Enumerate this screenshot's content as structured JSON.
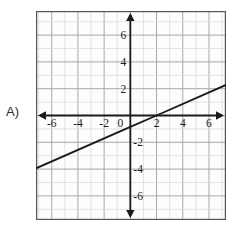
{
  "question": {
    "label": "A)"
  },
  "chart_data": {
    "type": "line",
    "title": "",
    "xlabel": "",
    "ylabel": "",
    "xlim": [
      -7.2,
      7.3
    ],
    "ylim": [
      -7.8,
      7.8
    ],
    "grid": true,
    "grid_step": 1,
    "legend": "none",
    "axis_arrows": true,
    "x_ticks": [
      -6,
      -4,
      -2,
      0,
      2,
      4,
      6
    ],
    "x_tick_labels": [
      "-6",
      "-4",
      "-2",
      "0",
      "2",
      "4",
      "6"
    ],
    "y_ticks": [
      -6,
      -4,
      -2,
      2,
      4,
      6
    ],
    "y_tick_labels": [
      "-6",
      "-4",
      "-2",
      "2",
      "4",
      "6"
    ],
    "origin_label": "0",
    "series": [
      {
        "name": "line",
        "type": "line",
        "slope": 0.4286,
        "intercept": -0.85,
        "x_intercept": 2,
        "points": [
          {
            "x": -7.2,
            "y": -3.94
          },
          {
            "x": 0,
            "y": -0.85
          },
          {
            "x": 2,
            "y": 0
          },
          {
            "x": 7.3,
            "y": 2.28
          }
        ],
        "color": "#1a1a1a"
      }
    ],
    "colors": {
      "axis": "#1a1a1a",
      "grid_major": "#a8a8a8",
      "grid_minor": "#dcdcdc",
      "border": "#555555",
      "plot_background": "#fdfdfd",
      "line": "#1a1a1a",
      "tick_text": "#1c1c1c"
    }
  }
}
